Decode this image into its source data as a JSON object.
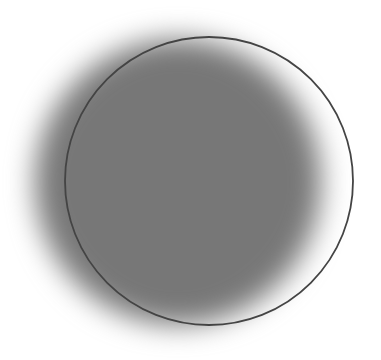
{
  "canvas": {
    "width": 381,
    "height": 360,
    "background": "#ffffff"
  },
  "shapes": {
    "blurred_disc": {
      "cx": 178,
      "cy": 182,
      "r": 143,
      "color": "#777777",
      "blur": 14
    },
    "outline_circle": {
      "cx": 209,
      "cy": 181,
      "r": 144,
      "stroke": "#444444",
      "stroke_width": 1.8
    }
  }
}
